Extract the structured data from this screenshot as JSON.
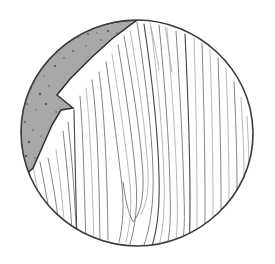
{
  "figure": {
    "type": "line-drawing",
    "canvas": {
      "width": 275,
      "height": 264,
      "background_color": "#ffffff"
    },
    "circle": {
      "name": "log-cross-section-outline",
      "center_x": 137,
      "center_y": 133,
      "radius_x": 116,
      "radius_y": 113,
      "stroke_color": "#3a3a3a",
      "fill_color": "#ffffff"
    },
    "shaded_wedge": {
      "name": "shaded-sapwood-wedge",
      "fill_color": "#a8a8a8",
      "stroke_color": "#2e2e2e",
      "description": "Gray crescent wedge at upper-left with a notch cut into its inner edge",
      "texture": "speckled",
      "speckle_color": "#3a3a3a",
      "speckle_count": 26
    },
    "grain": {
      "name": "wood-grain-lines",
      "line_color": "#6e6e72",
      "strong_line_color": "#4a4a4e",
      "faint_line_color": "#9a9a9e",
      "count": 34,
      "pattern": "vertical cathedral grain with central V"
    }
  }
}
